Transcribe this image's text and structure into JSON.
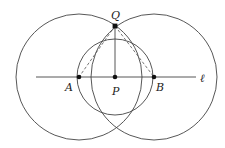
{
  "diagram": {
    "type": "geometric-construction",
    "labels": {
      "A": "A",
      "B": "B",
      "P": "P",
      "Q": "Q",
      "line": "ℓ"
    },
    "points": [
      {
        "name": "A",
        "x": 79,
        "y": 77
      },
      {
        "name": "P",
        "x": 115,
        "y": 77
      },
      {
        "name": "B",
        "x": 154,
        "y": 77
      },
      {
        "name": "Q",
        "x": 115,
        "y": 26
      }
    ],
    "circles": [
      {
        "center": "A",
        "r": 63
      },
      {
        "center": "B",
        "r": 63
      },
      {
        "center": "P",
        "r": 38
      }
    ],
    "segments": [
      {
        "from": "Q",
        "to": "P",
        "style": "solid"
      },
      {
        "from": "Q",
        "to": "A",
        "style": "dashed"
      },
      {
        "from": "Q",
        "to": "B",
        "style": "dashed"
      }
    ],
    "line": {
      "x1": 36,
      "x2": 196,
      "y": 77
    },
    "colors": {
      "stroke": "#444444",
      "point": "#111111",
      "background": "#ffffff"
    }
  }
}
